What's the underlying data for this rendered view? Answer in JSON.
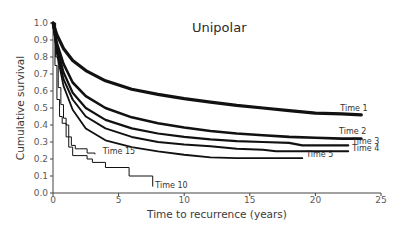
{
  "chart_data": {
    "type": "line",
    "title": "Unipolar",
    "xlabel": "Time to recurrence (years)",
    "ylabel": "Cumulative survival",
    "xlim": [
      0,
      25
    ],
    "ylim": [
      0.0,
      1.0
    ],
    "x_ticks": [
      "0",
      "5",
      "10",
      "15",
      "20",
      "25"
    ],
    "y_ticks": [
      "0.0",
      "0.1",
      "0.2",
      "0.3",
      "0.4",
      "0.5",
      "0.6",
      "0.7",
      "0.8",
      "0.9",
      "1.0"
    ],
    "grid": false,
    "legend": "inline labels at curve ends",
    "series": [
      {
        "name": "Time 1",
        "step": false,
        "width": 3.2,
        "x": [
          0,
          0.3,
          0.8,
          1.5,
          2.5,
          4,
          6,
          8,
          10,
          12,
          14,
          16,
          18,
          20,
          22,
          23.5
        ],
        "y": [
          1.0,
          0.93,
          0.85,
          0.78,
          0.72,
          0.66,
          0.61,
          0.58,
          0.555,
          0.535,
          0.515,
          0.5,
          0.485,
          0.47,
          0.465,
          0.46
        ]
      },
      {
        "name": "Time 2",
        "step": false,
        "width": 2.6,
        "x": [
          0,
          0.3,
          0.8,
          1.5,
          2.5,
          4,
          6,
          8,
          10,
          12,
          14,
          16,
          18,
          20,
          22,
          23.5
        ],
        "y": [
          1.0,
          0.88,
          0.76,
          0.65,
          0.57,
          0.5,
          0.445,
          0.41,
          0.385,
          0.365,
          0.35,
          0.34,
          0.33,
          0.325,
          0.32,
          0.32
        ]
      },
      {
        "name": "Time 3",
        "step": false,
        "width": 2.2,
        "x": [
          0,
          0.3,
          0.8,
          1.5,
          2.5,
          4,
          6,
          8,
          10,
          12,
          14,
          16,
          18,
          19,
          20,
          22.5
        ],
        "y": [
          1.0,
          0.86,
          0.71,
          0.59,
          0.5,
          0.43,
          0.38,
          0.35,
          0.33,
          0.315,
          0.305,
          0.3,
          0.295,
          0.28,
          0.28,
          0.28
        ]
      },
      {
        "name": "Time 4",
        "step": false,
        "width": 2.0,
        "x": [
          0,
          0.3,
          0.8,
          1.5,
          2.5,
          4,
          6,
          8,
          10,
          12,
          14,
          16,
          17,
          18,
          20,
          22.5
        ],
        "y": [
          1.0,
          0.84,
          0.67,
          0.55,
          0.45,
          0.38,
          0.33,
          0.3,
          0.285,
          0.275,
          0.26,
          0.255,
          0.245,
          0.245,
          0.245,
          0.245
        ]
      },
      {
        "name": "Time 5",
        "step": false,
        "width": 1.8,
        "x": [
          0,
          0.3,
          0.8,
          1.5,
          2.5,
          4,
          6,
          8,
          10,
          12,
          14,
          16,
          18,
          19
        ],
        "y": [
          1.0,
          0.82,
          0.63,
          0.49,
          0.38,
          0.31,
          0.27,
          0.245,
          0.225,
          0.21,
          0.205,
          0.205,
          0.205,
          0.205
        ]
      },
      {
        "name": "Time 15",
        "step": true,
        "width": 1.0,
        "x": [
          0,
          0.2,
          0.4,
          0.6,
          0.8,
          1.0,
          1.2,
          1.4,
          1.7,
          2.0,
          2.6,
          3.2
        ],
        "y": [
          1.0,
          0.8,
          0.62,
          0.52,
          0.44,
          0.4,
          0.33,
          0.28,
          0.26,
          0.26,
          0.235,
          0.23
        ]
      },
      {
        "name": "Time 10",
        "step": true,
        "width": 1.0,
        "x": [
          0,
          0.15,
          0.3,
          0.5,
          0.7,
          1.0,
          1.2,
          1.5,
          2.6,
          3.0,
          4.0,
          5.8,
          7.6
        ],
        "y": [
          1.0,
          0.75,
          0.55,
          0.45,
          0.41,
          0.33,
          0.27,
          0.22,
          0.2,
          0.18,
          0.15,
          0.1,
          0.04
        ]
      }
    ],
    "annotations": [
      {
        "text": "Time 1",
        "x": 21.9,
        "y": 0.485
      },
      {
        "text": "Time 2",
        "x": 21.8,
        "y": 0.345
      },
      {
        "text": "Time 3",
        "x": 22.8,
        "y": 0.29
      },
      {
        "text": "Time 4",
        "x": 22.8,
        "y": 0.245
      },
      {
        "text": "Time 5",
        "x": 19.3,
        "y": 0.21
      },
      {
        "text": "Time 15",
        "x": 3.8,
        "y": 0.23
      },
      {
        "text": "Time 10",
        "x": 7.8,
        "y": 0.03
      }
    ]
  },
  "colors": {
    "line": "#111111",
    "axis": "#444444",
    "text": "#3a3a3a"
  }
}
